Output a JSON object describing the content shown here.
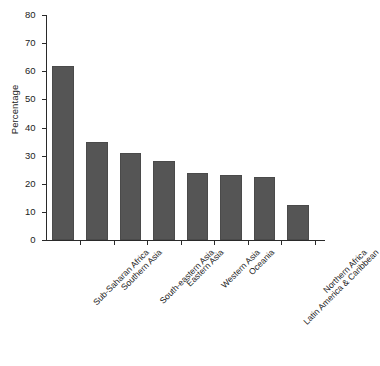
{
  "chart_data": {
    "type": "bar",
    "title": "",
    "subtitle": "",
    "xlabel": "",
    "ylabel": "Percentage",
    "ylim": [
      0,
      80
    ],
    "yticks": [
      0,
      10,
      20,
      30,
      40,
      50,
      60,
      70,
      80
    ],
    "grid": false,
    "legend": null,
    "orientation": "vertical",
    "bar_color": "#555555",
    "axis_color": "#2a2a2a",
    "categories": [
      "Sub-Saharan Africa",
      "Southern Asia",
      "South-eastern Asia",
      "Eastern Asia",
      "Western Asia",
      "Oceania",
      "Latin America & Caribbean",
      "Northern Africa"
    ],
    "values": [
      62,
      35,
      31,
      28,
      24,
      23,
      22.5,
      12.5
    ],
    "category_label_rotation": -45
  },
  "figure": {
    "caption_fragment": ""
  }
}
